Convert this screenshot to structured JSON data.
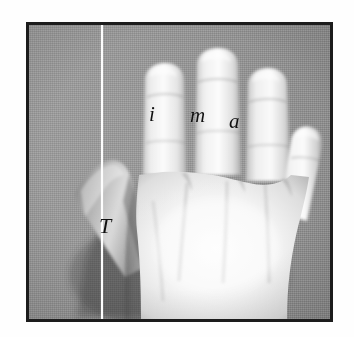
{
  "figure": {
    "kind": "photograph",
    "frame": {
      "border_color": "#1c1c1c",
      "background_color": "#969696",
      "page_color": "#ffffff"
    }
  },
  "annotations": {
    "reference_line": {
      "name": "vertical white line",
      "color": "#fdfdfd",
      "orientation": "vertical"
    },
    "labels": [
      {
        "id": "index",
        "text": "i",
        "meaning": "index finger"
      },
      {
        "id": "middle",
        "text": "m",
        "meaning": "middle finger"
      },
      {
        "id": "ring",
        "text": "a",
        "meaning": "ring finger"
      },
      {
        "id": "thumb",
        "text": "T",
        "meaning": "thumb"
      }
    ]
  },
  "hand": {
    "skin_highlight": "#fbfbfb",
    "skin_mid": "#e6e6e6",
    "skin_shadow": "#b9b9b9",
    "skin_deep_shadow": "#8f8f8f",
    "digits": [
      "thumb",
      "index",
      "middle",
      "ring",
      "little"
    ]
  }
}
